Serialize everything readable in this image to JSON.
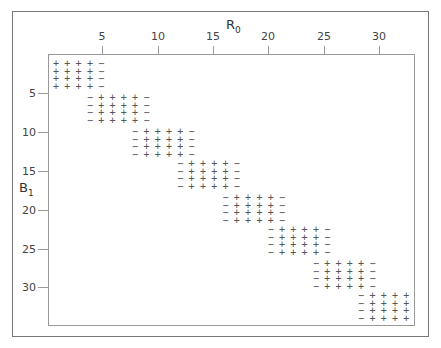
{
  "chart_data": {
    "type": "heatmap",
    "title": "",
    "xlabel": "R",
    "xlabel_sub": "0",
    "ylabel": "B",
    "ylabel_sub": "1",
    "x_ticks": [
      5,
      10,
      15,
      20,
      25,
      30
    ],
    "y_ticks": [
      5,
      10,
      15,
      20,
      25,
      30
    ],
    "x_range": [
      1,
      32
    ],
    "y_range": [
      1,
      32
    ],
    "legend": [],
    "symbols": {
      "positive": "+",
      "negative": "−"
    },
    "blocks": [
      {
        "rows": [
          1,
          2,
          3,
          4
        ],
        "minus_cols": [
          5
        ],
        "plus_cols": [
          1,
          2,
          3,
          4
        ]
      },
      {
        "rows": [
          5,
          6,
          7,
          8
        ],
        "minus_cols": [
          4,
          9
        ],
        "plus_cols": [
          5,
          6,
          7,
          8
        ]
      },
      {
        "rows": [
          9,
          10,
          11,
          12
        ],
        "minus_cols": [
          8,
          13
        ],
        "plus_cols": [
          9,
          10,
          11,
          12
        ]
      },
      {
        "rows": [
          13,
          14,
          15,
          16
        ],
        "minus_cols": [
          12,
          17
        ],
        "plus_cols": [
          13,
          14,
          15,
          16
        ]
      },
      {
        "rows": [
          17,
          18,
          19,
          20
        ],
        "minus_cols": [
          16,
          21
        ],
        "plus_cols": [
          17,
          18,
          19,
          20
        ]
      },
      {
        "rows": [
          21,
          22,
          23,
          24
        ],
        "minus_cols": [
          20,
          25
        ],
        "plus_cols": [
          21,
          22,
          23,
          24
        ]
      },
      {
        "rows": [
          25,
          26,
          27,
          28
        ],
        "minus_cols": [
          24,
          29
        ],
        "plus_cols": [
          25,
          26,
          27,
          28
        ]
      },
      {
        "rows": [
          29,
          30,
          31,
          32
        ],
        "minus_cols": [
          28
        ],
        "plus_cols": [
          29,
          30,
          31,
          32
        ]
      }
    ]
  },
  "layout": {
    "x_tick_px": [
      102,
      158,
      213,
      268,
      324,
      379
    ],
    "y_tick_px": [
      93,
      132,
      171,
      210,
      249,
      287
    ],
    "block_top_px": [
      64,
      98,
      132,
      164,
      198,
      230,
      264,
      296
    ],
    "row_step_px": 7.7,
    "col1_px": 56,
    "col_step_px": 11.3
  }
}
